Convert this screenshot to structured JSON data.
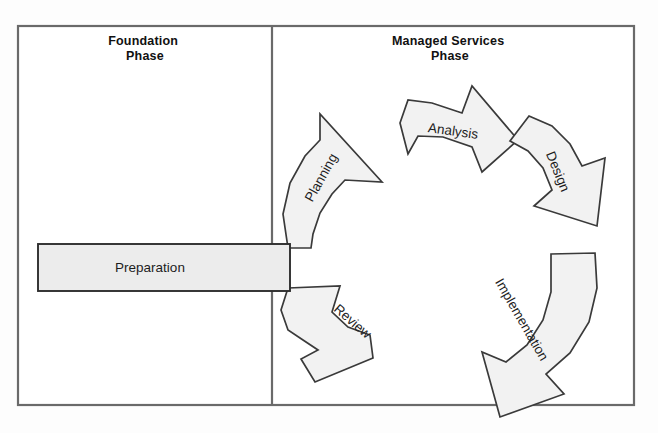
{
  "diagram": {
    "background_color": "#ffffff",
    "frame": {
      "border_color": "#6a6a6a",
      "x": 18,
      "y": 26,
      "width": 616,
      "height": 379,
      "divider_x": 272
    },
    "panels": [
      {
        "id": "foundation",
        "heading_line1": "Foundation",
        "heading_line2": "Phase",
        "heading_x": 145,
        "heading_y": 45
      },
      {
        "id": "managed-services",
        "heading_line1": "Managed Services",
        "heading_line2": "Phase",
        "heading_x": 450,
        "heading_y": 45
      }
    ],
    "preparation": {
      "label": "Preparation",
      "fill_color": "#ececec",
      "stroke_color": "#2e2e2e",
      "x": 38,
      "y": 244,
      "width": 252,
      "height": 47,
      "label_x": 150,
      "label_y": 268
    },
    "connector": {
      "x": 288,
      "y1": 248,
      "y2": 290
    },
    "cycle": {
      "direction": "clockwise",
      "center_x": 455,
      "center_y": 248,
      "fill_color": "#f2f2f2",
      "stroke_color": "#3a3a3a",
      "steps": [
        {
          "order": 1,
          "label": "Planning",
          "label_x": 322,
          "label_y": 178,
          "rotation": -61,
          "points": "288,248 283,214 290,183 305,156 320,140 320,114 382,182 345,180 332,194 320,213 313,234 311,248"
        },
        {
          "order": 2,
          "label": "Analysis",
          "label_x": 453,
          "label_y": 132,
          "rotation": 8,
          "points": "400,123 408,100 432,103 462,113 472,86 518,140 482,172 472,147 443,137 418,136 408,154"
        },
        {
          "order": 3,
          "label": "Design",
          "label_x": 557,
          "label_y": 172,
          "rotation": 68,
          "points": "529,116 552,126 570,144 582,166 605,158 597,226 534,206 552,190 543,168 528,151 510,141"
        },
        {
          "order": 4,
          "label": "Implementation",
          "label_x": 521,
          "label_y": 320,
          "rotation": 60,
          "points": "595,253 597,288 589,322 570,353 546,374 564,394 500,417 482,352 506,362 527,345 543,320 551,292 551,254"
        },
        {
          "order": 5,
          "label": "Review",
          "label_x": 352,
          "label_y": 322,
          "rotation": 41,
          "points": "288,288 340,286 332,312 348,327 370,335 373,358 315,382 301,359 318,350 303,340 288,330 281,310"
        }
      ]
    }
  }
}
